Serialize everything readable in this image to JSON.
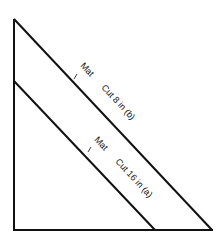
{
  "diagram": {
    "type": "mat-cut-triangle",
    "stroke_color": "#111111",
    "background": "#ffffff",
    "outer_triangle": {
      "points": [
        [
          14,
          19
        ],
        [
          14,
          230
        ],
        [
          212,
          230
        ]
      ]
    },
    "cut_lines": [
      {
        "id": "b",
        "from": [
          14,
          19
        ],
        "to": [
          212,
          230
        ],
        "mat_label": "Mat",
        "cut_label": "Cut 8 in (b)"
      },
      {
        "id": "a",
        "from": [
          14,
          81
        ],
        "to": [
          155,
          230
        ],
        "mat_label": "Mat",
        "cut_label": "Cut 16 in (a)"
      }
    ]
  }
}
